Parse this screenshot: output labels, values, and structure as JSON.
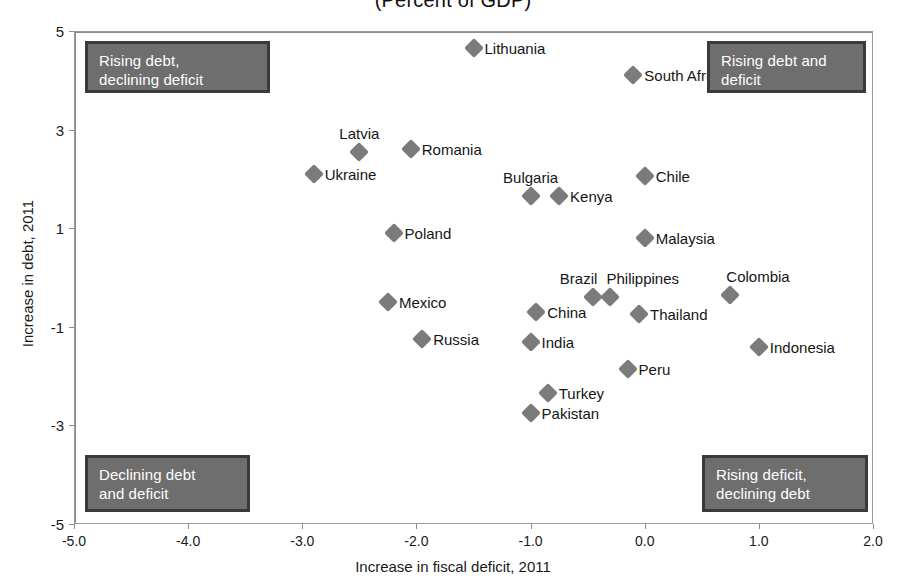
{
  "chart_data": {
    "type": "scatter",
    "title": "(Percent of GDP)",
    "xlabel": "Increase in fiscal deficit, 2011",
    "ylabel": "Increase in debt, 2011",
    "xlim": [
      -5.0,
      2.0
    ],
    "ylim": [
      -5,
      5
    ],
    "xticks": [
      "-5.0",
      "-4.0",
      "-3.0",
      "-2.0",
      "-1.0",
      "0.0",
      "1.0",
      "2.0"
    ],
    "xtick_values": [
      -5.0,
      -4.0,
      -3.0,
      -2.0,
      -1.0,
      0.0,
      1.0,
      2.0
    ],
    "yticks": [
      "5",
      "3",
      "1",
      "-1",
      "-3",
      "-5"
    ],
    "ytick_values": [
      5,
      3,
      1,
      -1,
      -3,
      -5
    ],
    "grid": false,
    "legend": "none",
    "reference_lines": {
      "x": 0.0,
      "y": 0.0
    },
    "marker": {
      "shape": "diamond",
      "color": "#7b7b7b",
      "size": 14
    },
    "points": [
      {
        "name": "Lithuania",
        "x": -1.5,
        "y": 4.65,
        "label_pos": "right"
      },
      {
        "name": "South Africa",
        "x": -0.1,
        "y": 4.1,
        "label_pos": "right"
      },
      {
        "name": "Latvia",
        "x": -2.5,
        "y": 2.55,
        "label_pos": "above"
      },
      {
        "name": "Romania",
        "x": -2.05,
        "y": 2.6,
        "label_pos": "right"
      },
      {
        "name": "Ukraine",
        "x": -2.9,
        "y": 2.1,
        "label_pos": "right"
      },
      {
        "name": "Chile",
        "x": 0.0,
        "y": 2.05,
        "label_pos": "right"
      },
      {
        "name": "Bulgaria",
        "x": -1.0,
        "y": 1.65,
        "label_pos": "above"
      },
      {
        "name": "Kenya",
        "x": -0.75,
        "y": 1.65,
        "label_pos": "right"
      },
      {
        "name": "Malaysia",
        "x": 0.0,
        "y": 0.8,
        "label_pos": "right"
      },
      {
        "name": "Poland",
        "x": -2.2,
        "y": 0.9,
        "label_pos": "right"
      },
      {
        "name": "Colombia",
        "x": 0.75,
        "y": -0.35,
        "label_pos": "above-right"
      },
      {
        "name": "Mexico",
        "x": -2.25,
        "y": -0.5,
        "label_pos": "right"
      },
      {
        "name": "Brazil",
        "x": -0.45,
        "y": -0.4,
        "label_pos": "above-left"
      },
      {
        "name": "Philippines",
        "x": -0.3,
        "y": -0.4,
        "label_pos": "above-right"
      },
      {
        "name": "China",
        "x": -0.95,
        "y": -0.7,
        "label_pos": "right"
      },
      {
        "name": "Thailand",
        "x": -0.05,
        "y": -0.75,
        "label_pos": "right"
      },
      {
        "name": "Russia",
        "x": -1.95,
        "y": -1.25,
        "label_pos": "right"
      },
      {
        "name": "India",
        "x": -1.0,
        "y": -1.3,
        "label_pos": "right"
      },
      {
        "name": "Indonesia",
        "x": 1.0,
        "y": -1.4,
        "label_pos": "right"
      },
      {
        "name": "Peru",
        "x": -0.15,
        "y": -1.85,
        "label_pos": "right"
      },
      {
        "name": "Turkey",
        "x": -0.85,
        "y": -2.35,
        "label_pos": "right"
      },
      {
        "name": "Pakistan",
        "x": -1.0,
        "y": -2.75,
        "label_pos": "right"
      }
    ],
    "annotations": [
      {
        "id": "top-left",
        "text": "Rising debt,\ndeclining deficit",
        "quadrant": "upper-left"
      },
      {
        "id": "top-right",
        "text": "Rising debt and\ndeficit",
        "quadrant": "upper-right"
      },
      {
        "id": "bottom-left",
        "text": "Declining debt\nand deficit",
        "quadrant": "lower-left"
      },
      {
        "id": "bottom-right",
        "text": "Rising deficit,\ndeclining debt",
        "quadrant": "lower-right"
      }
    ]
  },
  "colors": {
    "marker": "#7b7b7b",
    "callout_fill": "#6e6e6e",
    "callout_border": "#3a3a3a",
    "callout_text": "#ffffff",
    "axis": "#8c8c8c",
    "text": "#1a1a1a"
  }
}
